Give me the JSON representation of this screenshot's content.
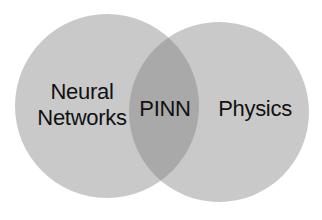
{
  "diagram": {
    "type": "venn",
    "sets": [
      {
        "id": "left",
        "label_lines": [
          "Neural",
          "Networks"
        ],
        "fill": "#c9c9c9",
        "center": [
          107,
          106
        ],
        "radius": 92
      },
      {
        "id": "right",
        "label_lines": [
          "Physics"
        ],
        "fill": "#c9c9c9",
        "center": [
          219,
          112
        ],
        "radius": 90
      }
    ],
    "intersection": {
      "label": "PINN",
      "fill": "#a9a9a9"
    },
    "background": "#ffffff",
    "text_color": "#111111"
  }
}
